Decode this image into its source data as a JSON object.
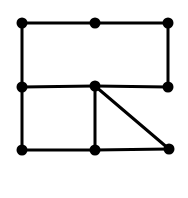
{
  "diagram": {
    "type": "graph",
    "background": "#ffffff",
    "stroke_color": "#000000",
    "node_color": "#000000",
    "node_radius": 5.5,
    "edge_width": 3,
    "nodes": [
      {
        "id": "A",
        "x": 22,
        "y": 23
      },
      {
        "id": "B",
        "x": 95,
        "y": 23
      },
      {
        "id": "C",
        "x": 168,
        "y": 23
      },
      {
        "id": "D",
        "x": 22,
        "y": 87
      },
      {
        "id": "E",
        "x": 95,
        "y": 86
      },
      {
        "id": "F",
        "x": 168,
        "y": 87
      },
      {
        "id": "G",
        "x": 22,
        "y": 150
      },
      {
        "id": "H",
        "x": 95,
        "y": 150
      },
      {
        "id": "I",
        "x": 169,
        "y": 149
      }
    ],
    "edges": [
      [
        "A",
        "B"
      ],
      [
        "B",
        "C"
      ],
      [
        "A",
        "D"
      ],
      [
        "C",
        "F"
      ],
      [
        "D",
        "E"
      ],
      [
        "E",
        "F"
      ],
      [
        "D",
        "G"
      ],
      [
        "E",
        "H"
      ],
      [
        "E",
        "I"
      ],
      [
        "G",
        "H"
      ],
      [
        "H",
        "I"
      ]
    ]
  }
}
